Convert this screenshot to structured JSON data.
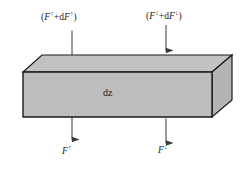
{
  "figure": {
    "name": "flux-divergence-slab-diagram",
    "slab_label": "dz",
    "colors": {
      "face_fill": "#bdbdbd",
      "top_fill": "#c2c2c2",
      "side_fill": "#b5b5b5",
      "stroke": "#1a1a1a",
      "background": "#ffffff",
      "arrow": "#3a3a3a"
    },
    "labels": {
      "top_left": {
        "open_paren": "(",
        "symbol": "F",
        "arrow": "↑",
        "plus": "+d",
        "symbol2": "F",
        "arrow2": "↑",
        "close_paren": ")",
        "full_text": "(F↑+dF↑)"
      },
      "top_right": {
        "open_paren": "(",
        "symbol": "F",
        "arrow": "↓",
        "plus": "+d",
        "symbol2": "F",
        "arrow2": "↓",
        "close_paren": ")",
        "full_text": "(F↓+dF↓)"
      },
      "bottom_left": {
        "symbol": "F",
        "arrow": "↑",
        "full_text": "F↑"
      },
      "bottom_right": {
        "symbol": "F",
        "arrow": "↓",
        "full_text": "F↓"
      }
    },
    "arrows": [
      {
        "id": "top-left-arrow",
        "direction": "up",
        "x": 72,
        "y_tail": 56,
        "y_head": 28
      },
      {
        "id": "top-right-arrow",
        "direction": "down",
        "x": 166,
        "y_tail": 25,
        "y_head": 53
      },
      {
        "id": "bottom-left-arrow",
        "direction": "down",
        "x": 72,
        "y_tail": 115,
        "y_head": 142
      },
      {
        "id": "bottom-right-arrow",
        "direction": "up",
        "x": 166,
        "y_tail": 143,
        "y_head": 116
      }
    ],
    "geometry": {
      "front_top_left": [
        23,
        72
      ],
      "front_top_right": [
        212,
        72
      ],
      "front_bot_left": [
        23,
        117
      ],
      "front_bot_right": [
        212,
        117
      ],
      "back_top_left": [
        42,
        55
      ],
      "back_top_right": [
        232,
        55
      ],
      "back_bot_right": [
        232,
        100
      ]
    }
  }
}
